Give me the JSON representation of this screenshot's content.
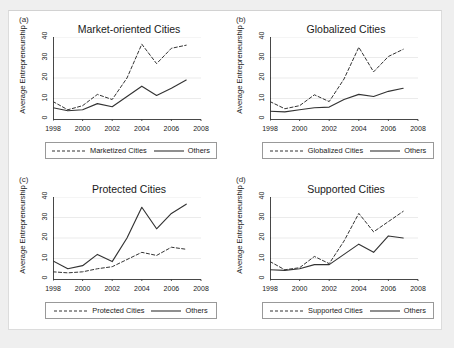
{
  "figure": {
    "background_color": "#efefef",
    "canvas_color": "#ffffff",
    "line_color": "#333333"
  },
  "chart_data": [
    {
      "type": "line",
      "panel_tag": "(a)",
      "title": "Market-oriented Cities",
      "xlabel": "",
      "ylabel": "Average Entrepreneurship",
      "xlim": [
        1998,
        2008
      ],
      "ylim": [
        0,
        40
      ],
      "xticks": [
        1998,
        2000,
        2002,
        2004,
        2006,
        2008
      ],
      "yticks": [
        0,
        10,
        20,
        30,
        40
      ],
      "grid": true,
      "legend_position": "below",
      "x": [
        1998,
        1999,
        2000,
        2001,
        2002,
        2003,
        2004,
        2005,
        2006,
        2007
      ],
      "series": [
        {
          "name": "Marketized Cities",
          "style": "dashed",
          "values": [
            8.5,
            4.5,
            6.5,
            12.0,
            9.5,
            20.0,
            36.5,
            27.0,
            34.5,
            36.0
          ]
        },
        {
          "name": "Others",
          "style": "solid",
          "values": [
            5.5,
            4.0,
            4.5,
            7.5,
            6.0,
            11.0,
            16.0,
            11.5,
            15.0,
            19.0
          ]
        }
      ]
    },
    {
      "type": "line",
      "panel_tag": "(b)",
      "title": "Globalized Cities",
      "xlabel": "",
      "ylabel": "Average Entrepreneurship",
      "xlim": [
        1998,
        2008
      ],
      "ylim": [
        0,
        40
      ],
      "xticks": [
        1998,
        2000,
        2002,
        2004,
        2006,
        2008
      ],
      "yticks": [
        0,
        10,
        20,
        30,
        40
      ],
      "grid": true,
      "legend_position": "below",
      "x": [
        1998,
        1999,
        2000,
        2001,
        2002,
        2003,
        2004,
        2005,
        2006,
        2007
      ],
      "series": [
        {
          "name": "Globalized Cities",
          "style": "dashed",
          "values": [
            8.5,
            5.0,
            6.5,
            11.8,
            8.5,
            19.5,
            35.0,
            23.0,
            30.5,
            34.0
          ]
        },
        {
          "name": "Others",
          "style": "solid",
          "values": [
            3.8,
            3.5,
            4.5,
            5.5,
            5.8,
            9.5,
            12.0,
            11.0,
            13.5,
            15.0
          ]
        }
      ]
    },
    {
      "type": "line",
      "panel_tag": "(c)",
      "title": "Protected Cities",
      "xlabel": "",
      "ylabel": "Average Entrepreneurship",
      "xlim": [
        1998,
        2008
      ],
      "ylim": [
        0,
        40
      ],
      "xticks": [
        1998,
        2000,
        2002,
        2004,
        2006,
        2008
      ],
      "yticks": [
        0,
        10,
        20,
        30,
        40
      ],
      "grid": true,
      "legend_position": "below",
      "x": [
        1998,
        1999,
        2000,
        2001,
        2002,
        2003,
        2004,
        2005,
        2006,
        2007
      ],
      "series": [
        {
          "name": "Protected Cities",
          "style": "dashed",
          "values": [
            3.5,
            3.0,
            3.5,
            5.0,
            6.0,
            9.5,
            13.0,
            11.5,
            15.5,
            14.5
          ]
        },
        {
          "name": "Others",
          "style": "solid",
          "values": [
            8.8,
            5.0,
            6.5,
            12.0,
            8.5,
            20.0,
            35.0,
            24.5,
            32.0,
            36.5
          ]
        }
      ]
    },
    {
      "type": "line",
      "panel_tag": "(d)",
      "title": "Supported Cities",
      "xlabel": "",
      "ylabel": "Average Entrepreneurship",
      "xlim": [
        1998,
        2008
      ],
      "ylim": [
        0,
        40
      ],
      "xticks": [
        1998,
        2000,
        2002,
        2004,
        2006,
        2008
      ],
      "yticks": [
        0,
        10,
        20,
        30,
        40
      ],
      "grid": true,
      "legend_position": "below",
      "x": [
        1998,
        1999,
        2000,
        2001,
        2002,
        2003,
        2004,
        2005,
        2006,
        2007
      ],
      "series": [
        {
          "name": "Supported Cities",
          "style": "dashed",
          "values": [
            8.5,
            4.5,
            5.5,
            11.0,
            7.5,
            18.5,
            32.0,
            23.0,
            28.0,
            33.0
          ]
        },
        {
          "name": "Others",
          "style": "solid",
          "values": [
            4.5,
            4.2,
            5.0,
            7.0,
            7.0,
            12.0,
            17.0,
            13.0,
            21.0,
            20.0
          ]
        }
      ]
    }
  ]
}
